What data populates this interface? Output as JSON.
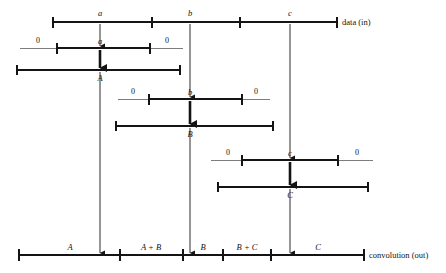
{
  "figure": {
    "type": "signal-convolution-diagram",
    "caption_top": "data (in)",
    "caption_bottom": "convolution (out)",
    "zero_label": "0",
    "ink_color": "#141414",
    "thin_color": "#6f6f6f"
  },
  "input_axis": {
    "name": "data-in-axis",
    "x_start": 53,
    "x_end": 337,
    "y": 22,
    "ticks": [
      53,
      152,
      240,
      337
    ],
    "samples": [
      {
        "label": "a",
        "x": 100
      },
      {
        "label": "b",
        "x": 190
      },
      {
        "label": "c",
        "x": 290
      }
    ],
    "caption": "data (in)"
  },
  "kernel_rows": [
    {
      "name": "kernel-row-a",
      "label": "a",
      "center_x": 100,
      "y": 48,
      "thin_start": 20,
      "thin_end": 183,
      "thick_start": 57,
      "thick_end": 150,
      "left_zero": "0",
      "right_zero": "0",
      "left_zero_x": 38,
      "right_zero_x": 167
    },
    {
      "name": "kernel-row-b",
      "label": "b",
      "center_x": 190,
      "y": 99,
      "thin_start": 118,
      "thin_end": 270,
      "thick_start": 149,
      "thick_end": 242,
      "left_zero": "0",
      "right_zero": "0",
      "left_zero_x": 133,
      "right_zero_x": 256
    },
    {
      "name": "kernel-row-c",
      "label": "c",
      "center_x": 290,
      "y": 160,
      "thin_start": 211,
      "thin_end": 373,
      "thick_start": 242,
      "thick_end": 338,
      "left_zero": "0",
      "right_zero": "0",
      "left_zero_x": 228,
      "right_zero_x": 357
    }
  ],
  "scaled_rows": [
    {
      "name": "scaled-row-A",
      "label": "A",
      "center_x": 100,
      "y": 70,
      "x_start": 17,
      "x_end": 180
    },
    {
      "name": "scaled-row-B",
      "label": "B",
      "center_x": 190,
      "y": 126,
      "x_start": 116,
      "x_end": 273
    },
    {
      "name": "scaled-row-C",
      "label": "C",
      "center_x": 290,
      "y": 187,
      "x_start": 218,
      "x_end": 368
    }
  ],
  "output_axis": {
    "name": "convolution-out-axis",
    "x_start": 19,
    "x_end": 364,
    "y": 255,
    "ticks": [
      19,
      120,
      183,
      223,
      271,
      364
    ],
    "segments": [
      {
        "label": "A",
        "center_x": 70
      },
      {
        "label": "A + B",
        "center_x": 151
      },
      {
        "label": "B",
        "center_x": 203
      },
      {
        "label": "B + C",
        "center_x": 247
      },
      {
        "label": "C",
        "center_x": 318
      }
    ],
    "caption": "convolution (out)"
  },
  "arrows": [
    {
      "name": "arrow-a-to-kernel",
      "x": 100,
      "y_start": 24,
      "y_end": 46,
      "weight": "thin"
    },
    {
      "name": "arrow-a-to-A",
      "x": 100,
      "y_start": 50,
      "y_end": 68,
      "weight": "thick"
    },
    {
      "name": "arrow-A-to-output",
      "x": 100,
      "y_start": 72,
      "y_end": 253,
      "weight": "thin"
    },
    {
      "name": "arrow-b-to-kernel",
      "x": 190,
      "y_start": 24,
      "y_end": 97,
      "weight": "thin"
    },
    {
      "name": "arrow-b-to-B",
      "x": 190,
      "y_start": 101,
      "y_end": 124,
      "weight": "thick"
    },
    {
      "name": "arrow-B-to-output",
      "x": 190,
      "y_start": 128,
      "y_end": 253,
      "weight": "thin"
    },
    {
      "name": "arrow-c-to-kernel",
      "x": 290,
      "y_start": 24,
      "y_end": 158,
      "weight": "thin"
    },
    {
      "name": "arrow-c-to-C",
      "x": 290,
      "y_start": 162,
      "y_end": 185,
      "weight": "thick"
    },
    {
      "name": "arrow-C-to-output",
      "x": 290,
      "y_start": 189,
      "y_end": 253,
      "weight": "thin"
    }
  ]
}
